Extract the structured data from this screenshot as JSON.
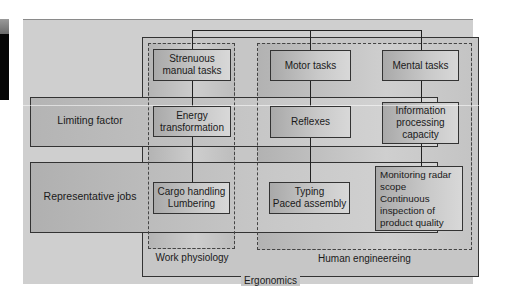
{
  "diagram": {
    "title": "Ergonomics",
    "disciplines": [
      {
        "id": "work_physiology",
        "label": "Work physiology"
      },
      {
        "id": "human_engineering",
        "label": "Human engineereing"
      }
    ],
    "rows": [
      {
        "id": "limiting_factor",
        "label": "Limiting factor"
      },
      {
        "id": "representative_jobs",
        "label": "Representative jobs"
      }
    ],
    "columns": [
      {
        "discipline": "work_physiology",
        "task": "Strenuous\nmanual tasks",
        "limiting_factor": "Energy\ntransformation",
        "jobs": "Cargo handling\nLumbering"
      },
      {
        "discipline": "human_engineering",
        "task": "Motor tasks",
        "limiting_factor": "Reflexes",
        "jobs": "Typing\nPaced assembly"
      },
      {
        "discipline": "human_engineering",
        "task": "Mental tasks",
        "limiting_factor": "Information\nprocessing\ncapacity",
        "jobs": "Monitoring radar\n    scope\nContinuous\n    inspection of\n    product quality"
      }
    ],
    "colors": {
      "background": "#cfcfcf",
      "box_fill": "#c4c4c4",
      "line": "#222222",
      "left_strip": "#050505"
    }
  }
}
